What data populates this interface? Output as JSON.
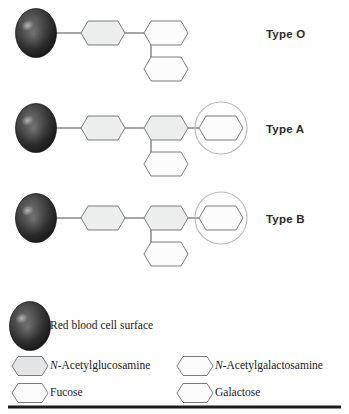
{
  "figure": {
    "background_color": "#ffffff",
    "rows": [
      {
        "id": "type-o",
        "label": "Type O",
        "label_x": 266,
        "label_y": 28,
        "cell_cx": 36,
        "cell_cy": 33,
        "highlight": false,
        "sugars": [
          {
            "name": "N-Acetylglucosamine",
            "shape": "hexagon",
            "fill": "#eceded",
            "cx": 103,
            "cy": 33
          },
          {
            "name": "Galactose",
            "shape": "hexagon",
            "fill": "#fcfcfc",
            "cx": 166,
            "cy": 33
          },
          {
            "name": "Fucose",
            "shape": "hexagon",
            "fill": "#fcfcfc",
            "cx": 166,
            "cy": 69
          }
        ]
      },
      {
        "id": "type-a",
        "label": "Type A",
        "label_x": 266,
        "label_y": 123,
        "cell_cx": 36,
        "cell_cy": 128,
        "highlight": true,
        "highlight_cx": 221,
        "highlight_cy": 128,
        "highlight_r": 26,
        "sugars": [
          {
            "name": "N-Acetylglucosamine",
            "shape": "hexagon",
            "fill": "#eceded",
            "cx": 103,
            "cy": 128
          },
          {
            "name": "Galactose",
            "shape": "hexagon",
            "fill": "#eceded",
            "cx": 166,
            "cy": 128
          },
          {
            "name": "Fucose",
            "shape": "hexagon",
            "fill": "#fcfcfc",
            "cx": 166,
            "cy": 164
          },
          {
            "name": "N-Acetylgalactosamine",
            "shape": "hexagon",
            "fill": "#fcfcfc",
            "cx": 221,
            "cy": 128
          }
        ]
      },
      {
        "id": "type-b",
        "label": "Type B",
        "label_x": 266,
        "label_y": 213,
        "cell_cx": 36,
        "cell_cy": 218,
        "highlight": true,
        "highlight_cx": 221,
        "highlight_cy": 218,
        "highlight_r": 26,
        "sugars": [
          {
            "name": "N-Acetylglucosamine",
            "shape": "hexagon",
            "fill": "#eceded",
            "cx": 103,
            "cy": 218
          },
          {
            "name": "Galactose",
            "shape": "hexagon",
            "fill": "#eceded",
            "cx": 166,
            "cy": 218
          },
          {
            "name": "Fucose",
            "shape": "hexagon",
            "fill": "#fcfcfc",
            "cx": 166,
            "cy": 254
          },
          {
            "name": "Galactose",
            "shape": "hexagon",
            "fill": "#fcfcfc",
            "cx": 221,
            "cy": 218
          }
        ]
      }
    ]
  },
  "legend": {
    "cell_entry": {
      "label": "Red blood cell surface",
      "icon": "red-blood-cell-icon",
      "cx": 30,
      "cy": 326,
      "text_x": 50,
      "text_y": 326
    },
    "entries": [
      {
        "id": "glcnac",
        "prefix": "N",
        "prefix_italic": true,
        "label": "-Acetylglucosamine",
        "fill": "#e4e5e6",
        "cx": 30,
        "cy": 366,
        "text_x": 50,
        "text_y": 366
      },
      {
        "id": "galnac",
        "prefix": "N",
        "prefix_italic": true,
        "label": "-Acetylgalactosamine",
        "fill": "#fcfcfc",
        "cx": 195,
        "cy": 366,
        "text_x": 215,
        "text_y": 366
      },
      {
        "id": "fucose",
        "prefix": "",
        "prefix_italic": false,
        "label": "Fucose",
        "fill": "#fcfcfc",
        "cx": 30,
        "cy": 393,
        "text_x": 50,
        "text_y": 393
      },
      {
        "id": "galactose",
        "prefix": "",
        "prefix_italic": false,
        "label": "Galactose",
        "fill": "#fcfcfc",
        "cx": 195,
        "cy": 393,
        "text_x": 215,
        "text_y": 393
      }
    ]
  },
  "bottom_rule": {
    "y": 407,
    "x1": 8,
    "x2": 341,
    "thickness": 3.2,
    "color": "#1c1c1c"
  },
  "colors": {
    "stroke": "#6e6e6e",
    "hex_fill_gray": "#eceded",
    "hex_fill_white": "#fcfcfc",
    "cell_dark": "#1f1f1f",
    "cell_mid": "#4a4a4a",
    "cell_light": "#7e7e7e",
    "highlight_circle": "#b9b9b9",
    "connector": "#555555",
    "rule": "#1c1c1c",
    "label_text": "#2b2b2b",
    "legend_text": "#1a1a1a"
  }
}
